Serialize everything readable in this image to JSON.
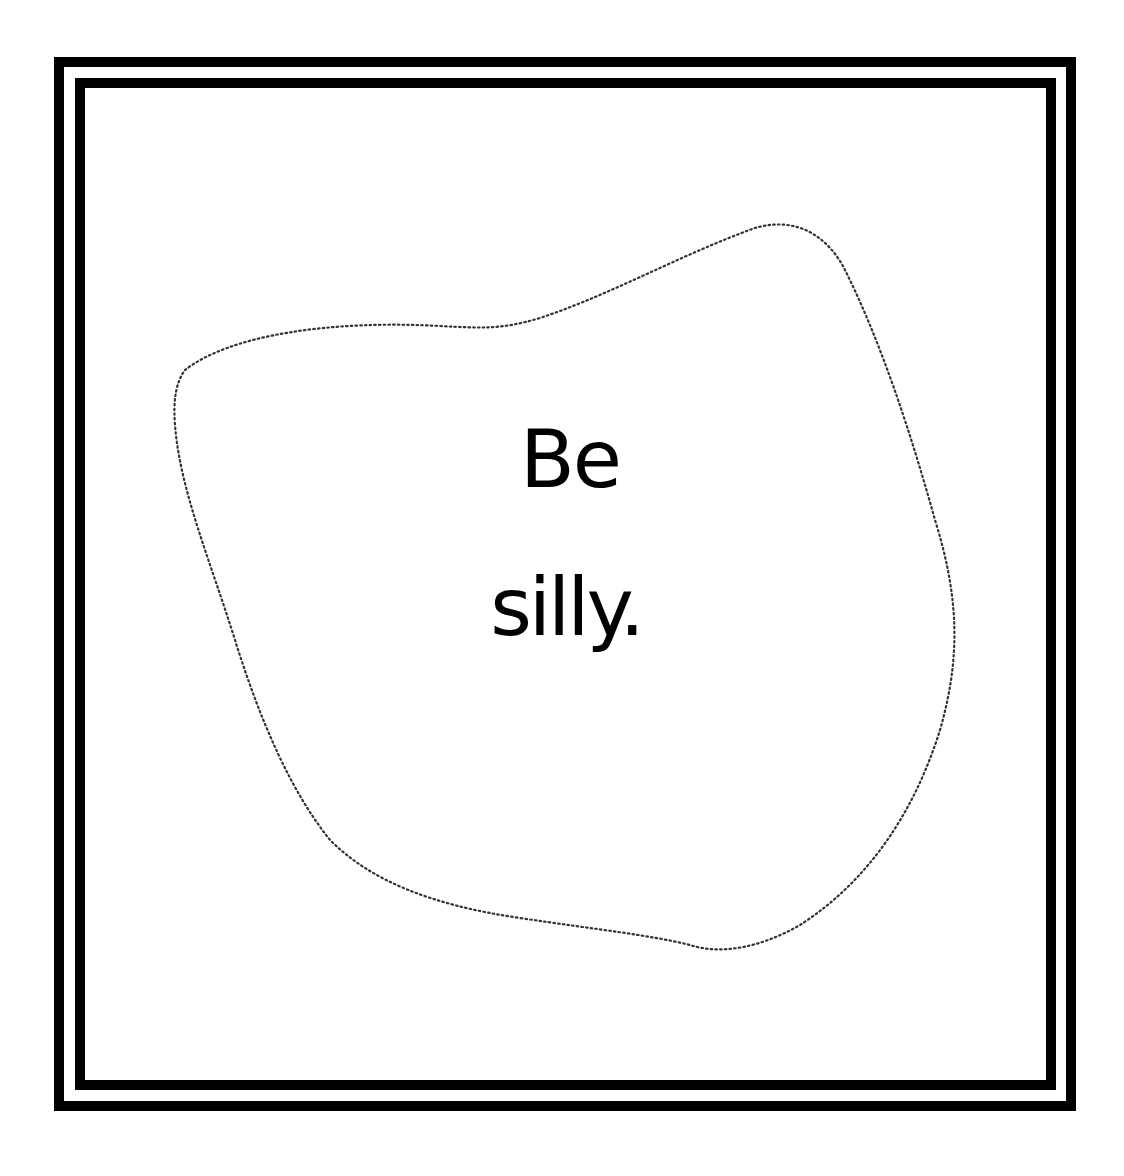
{
  "page": {
    "background": "#ffffff",
    "frame_color": "#000000"
  },
  "message": {
    "line1": "Be",
    "line2": "silly."
  },
  "blob": {
    "style": "dotted-outline",
    "color": "#333333"
  }
}
